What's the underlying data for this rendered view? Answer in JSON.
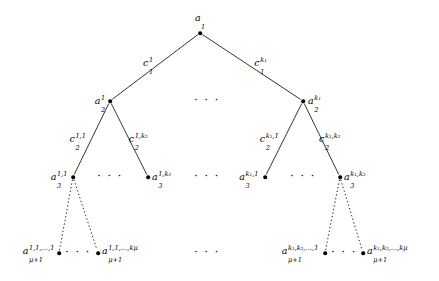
{
  "figure": {
    "type": "tree-diagram",
    "background_color": "#ffffff",
    "line_color": "#000000",
    "node_color": "#000000",
    "solid_edge_style": "solid",
    "elided_edge_style": "dotted"
  },
  "levels": [
    {
      "level": 1,
      "nodes": [
        {
          "id": "root",
          "label_base": "a",
          "label_sub": "1",
          "label_sup": "",
          "x": 200,
          "y": 33,
          "label_x": 200,
          "label_y": 18,
          "anchor": "center"
        }
      ]
    },
    {
      "level": 2,
      "nodes": [
        {
          "id": "n2-1",
          "label_base": "a",
          "label_sub": "2",
          "label_sup": "1",
          "x": 110,
          "y": 101,
          "label_x": 105,
          "label_y": 101,
          "anchor": "right"
        },
        {
          "id": "n2-k",
          "label_base": "a",
          "label_sub": "2",
          "label_sup": "k1",
          "x": 303,
          "y": 101,
          "label_x": 308,
          "label_y": 101,
          "anchor": "left"
        }
      ],
      "ellipsis": [
        {
          "x": 207,
          "y": 100
        }
      ]
    },
    {
      "level": 3,
      "nodes": [
        {
          "id": "n3-11",
          "label_base": "a",
          "label_sub": "3",
          "label_sup": "1,1",
          "x": 73,
          "y": 177,
          "label_x": 68,
          "label_y": 177,
          "anchor": "right"
        },
        {
          "id": "n3-1k",
          "label_base": "a",
          "label_sub": "3",
          "label_sup": "1,k2",
          "x": 148,
          "y": 177,
          "label_x": 152,
          "label_y": 177,
          "anchor": "left"
        },
        {
          "id": "n3-k1",
          "label_base": "a",
          "label_sub": "3",
          "label_sup": "k1,1",
          "x": 265,
          "y": 177,
          "label_x": 260,
          "label_y": 177,
          "anchor": "right"
        },
        {
          "id": "n3-kk",
          "label_base": "a",
          "label_sub": "3",
          "label_sup": "k1,k2",
          "x": 340,
          "y": 177,
          "label_x": 344,
          "label_y": 177,
          "anchor": "left"
        }
      ],
      "ellipsis": [
        {
          "x": 110,
          "y": 176
        },
        {
          "x": 207,
          "y": 176
        },
        {
          "x": 303,
          "y": 176
        }
      ]
    },
    {
      "level": 4,
      "nodes": [
        {
          "id": "n4-111",
          "label_base": "a",
          "label_sub": "mu+1",
          "label_sup": "1,1,...,1",
          "x": 59,
          "y": 253,
          "label_x": 54,
          "label_y": 251,
          "anchor": "right"
        },
        {
          "id": "n4-11k",
          "label_base": "a",
          "label_sub": "mu+1",
          "label_sup": "1,1,...,kmu",
          "x": 98,
          "y": 253,
          "label_x": 102,
          "label_y": 251,
          "anchor": "left"
        },
        {
          "id": "n4-kk1",
          "label_base": "a",
          "label_sub": "mu+1",
          "label_sup": "k1,k2,...,1",
          "x": 325,
          "y": 253,
          "label_x": 320,
          "label_y": 251,
          "anchor": "right"
        },
        {
          "id": "n4-kkk",
          "label_base": "a",
          "label_sub": "mu+1",
          "label_sup": "k1,k2,...,kmu",
          "x": 363,
          "y": 253,
          "label_x": 367,
          "label_y": 251,
          "anchor": "left"
        }
      ],
      "ellipsis": [
        {
          "x": 78,
          "y": 252
        },
        {
          "x": 207,
          "y": 252
        },
        {
          "x": 344,
          "y": 252
        }
      ]
    }
  ],
  "edges": [
    {
      "id": "e-root-n2-1",
      "from": "root",
      "to": "n2-1",
      "x1": 200,
      "y1": 33,
      "x2": 110,
      "y2": 101,
      "style": "solid",
      "label_base": "c",
      "label_sub": "1",
      "label_sup": "1",
      "label_x": 148,
      "label_y": 63
    },
    {
      "id": "e-root-n2-k",
      "from": "root",
      "to": "n2-k",
      "x1": 200,
      "y1": 33,
      "x2": 303,
      "y2": 101,
      "style": "solid",
      "label_base": "c",
      "label_sub": "1",
      "label_sup": "k1",
      "label_x": 261,
      "label_y": 63
    },
    {
      "id": "e-n2-1-n3-11",
      "from": "n2-1",
      "to": "n3-11",
      "x1": 110,
      "y1": 101,
      "x2": 73,
      "y2": 177,
      "style": "solid",
      "label_base": "c",
      "label_sub": "2",
      "label_sup": "1,1",
      "label_x": 78,
      "label_y": 139
    },
    {
      "id": "e-n2-1-n3-1k",
      "from": "n2-1",
      "to": "n3-1k",
      "x1": 110,
      "y1": 101,
      "x2": 148,
      "y2": 177,
      "style": "solid",
      "label_base": "c",
      "label_sub": "2",
      "label_sup": "1,k2",
      "label_x": 139,
      "label_y": 139
    },
    {
      "id": "e-n2-k-n3-k1",
      "from": "n2-k",
      "to": "n3-k1",
      "x1": 303,
      "y1": 101,
      "x2": 265,
      "y2": 177,
      "style": "solid",
      "label_base": "c",
      "label_sub": "2",
      "label_sup": "k1,1",
      "label_x": 270,
      "label_y": 139
    },
    {
      "id": "e-n2-k-n3-kk",
      "from": "n2-k",
      "to": "n3-kk",
      "x1": 303,
      "y1": 101,
      "x2": 340,
      "y2": 177,
      "style": "solid",
      "label_base": "c",
      "label_sub": "2",
      "label_sup": "k1,k2",
      "label_x": 331,
      "label_y": 139
    },
    {
      "id": "e-n3-11-n4-111",
      "from": "n3-11",
      "to": "n4-111",
      "x1": 73,
      "y1": 177,
      "x2": 59,
      "y2": 253,
      "style": "dotted",
      "label_base": "",
      "label_sub": "",
      "label_sup": "",
      "label_x": 0,
      "label_y": 0
    },
    {
      "id": "e-n3-11-n4-11k",
      "from": "n3-11",
      "to": "n4-11k",
      "x1": 73,
      "y1": 177,
      "x2": 98,
      "y2": 253,
      "style": "dotted",
      "label_base": "",
      "label_sub": "",
      "label_sup": "",
      "label_x": 0,
      "label_y": 0
    },
    {
      "id": "e-n3-kk-n4-kk1",
      "from": "n3-kk",
      "to": "n4-kk1",
      "x1": 340,
      "y1": 177,
      "x2": 325,
      "y2": 253,
      "style": "dotted",
      "label_base": "",
      "label_sub": "",
      "label_sup": "",
      "label_x": 0,
      "label_y": 0
    },
    {
      "id": "e-n3-kk-n4-kkk",
      "from": "n3-kk",
      "to": "n4-kkk",
      "x1": 340,
      "y1": 177,
      "x2": 363,
      "y2": 253,
      "style": "dotted",
      "label_base": "",
      "label_sub": "",
      "label_sup": "",
      "label_x": 0,
      "label_y": 0
    }
  ],
  "glyphs": {
    "ellipsis": "· · ·",
    "mu": "μ"
  },
  "script_text": {
    "1": "1",
    "2": "2",
    "3": "3",
    "k1": "k₁",
    "k2": "k₂",
    "kmu": "kμ",
    "mu+1": "μ+1",
    "1,1": "1,1",
    "1,k2": "1,k₂",
    "k1,1": "k₁,1",
    "k1,k2": "k₁,k₂",
    "1,1,...,1": "1,1,…,1",
    "1,1,...,kmu": "1,1,…,kμ",
    "k1,k2,...,1": "k₁,k₂,…,1",
    "k1,k2,...,kmu": "k₁,k₂,…,kμ"
  }
}
